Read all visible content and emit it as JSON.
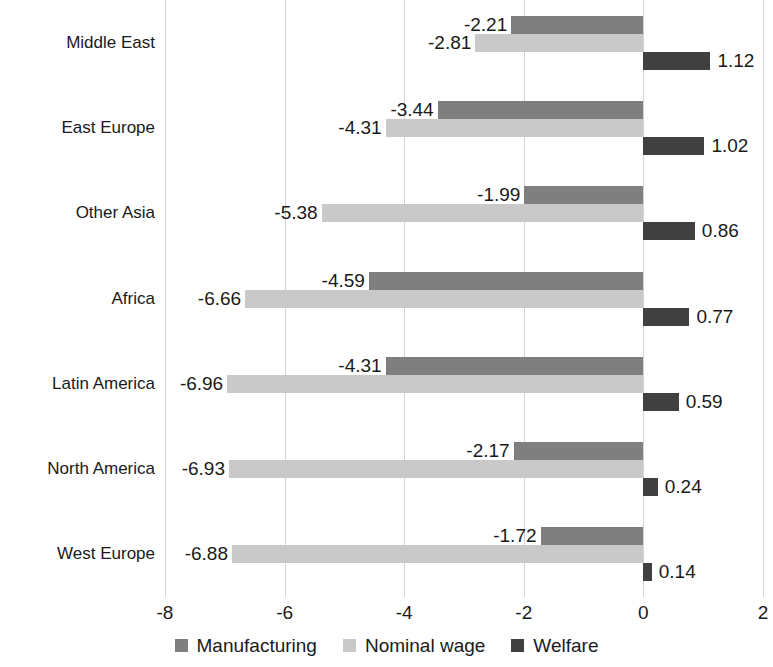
{
  "chart_data": {
    "type": "bar",
    "orientation": "horizontal",
    "title": "",
    "subtitle": "",
    "xlabel": "",
    "ylabel": "",
    "xlim": [
      -8,
      2
    ],
    "xticks": [
      -8,
      -6,
      -4,
      -2,
      0,
      2
    ],
    "xtick_labels": [
      "-8",
      "-6",
      "-4",
      "-2",
      "0",
      "2"
    ],
    "grid": true,
    "grid_axis": "x",
    "legend_position": "bottom",
    "categories": [
      "Middle East",
      "East Europe",
      "Other Asia",
      "Africa",
      "Latin America",
      "North America",
      "West Europe"
    ],
    "series": [
      {
        "name": "Manufacturing",
        "color": "#7f7f7f",
        "values": [
          -2.21,
          -3.44,
          -1.99,
          -4.59,
          -4.31,
          -2.17,
          -1.72
        ],
        "labels": [
          "-2.21",
          "-3.44",
          "-1.99",
          "-4.59",
          "-4.31",
          "-2.17",
          "-1.72"
        ]
      },
      {
        "name": "Nominal wage",
        "color": "#c9c9c9",
        "values": [
          -2.81,
          -4.31,
          -5.38,
          -6.66,
          -6.96,
          -6.93,
          -6.88
        ],
        "labels": [
          "-2.81",
          "-4.31",
          "-5.38",
          "-6.66",
          "-6.96",
          "-6.93",
          "-6.88"
        ]
      },
      {
        "name": "Welfare",
        "color": "#404040",
        "values": [
          1.12,
          1.02,
          0.86,
          0.77,
          0.59,
          0.24,
          0.14
        ],
        "labels": [
          "1.12",
          "1.02",
          "0.86",
          "0.77",
          "0.59",
          "0.24",
          "0.14"
        ]
      }
    ]
  },
  "legend": {
    "items": [
      {
        "label": "Manufacturing",
        "color": "#7f7f7f"
      },
      {
        "label": "Nominal wage",
        "color": "#c9c9c9"
      },
      {
        "label": "Welfare",
        "color": "#404040"
      }
    ]
  }
}
